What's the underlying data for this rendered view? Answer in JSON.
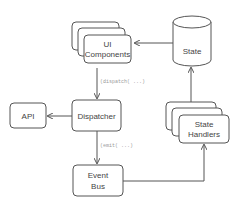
{
  "diagram": {
    "nodes": [
      {
        "id": "ui_components",
        "label_lines": [
          "UI",
          "Components"
        ],
        "shape": "stacked-rounded-rect"
      },
      {
        "id": "state",
        "label_lines": [
          "State"
        ],
        "shape": "cylinder"
      },
      {
        "id": "dispatcher",
        "label_lines": [
          "Dispatcher"
        ],
        "shape": "rounded-rect"
      },
      {
        "id": "api",
        "label_lines": [
          "API"
        ],
        "shape": "rounded-rect"
      },
      {
        "id": "event_bus",
        "label_lines": [
          "Event",
          "Bus"
        ],
        "shape": "rounded-rect"
      },
      {
        "id": "state_handlers",
        "label_lines": [
          "State",
          "Handlers"
        ],
        "shape": "stacked-rounded-rect"
      }
    ],
    "edges": [
      {
        "from": "state",
        "to": "ui_components",
        "label": ""
      },
      {
        "from": "ui_components",
        "to": "dispatcher",
        "label": "(dispatch( ...)"
      },
      {
        "from": "dispatcher",
        "to": "api",
        "label": ""
      },
      {
        "from": "dispatcher",
        "to": "event_bus",
        "label": "(emit( ...)"
      },
      {
        "from": "event_bus",
        "to": "state_handlers",
        "label": ""
      },
      {
        "from": "state_handlers",
        "to": "state",
        "label": ""
      }
    ],
    "colors": {
      "stroke": "#555555",
      "text": "#444444",
      "edge_label": "#9a9a9a",
      "background": "#ffffff"
    }
  }
}
